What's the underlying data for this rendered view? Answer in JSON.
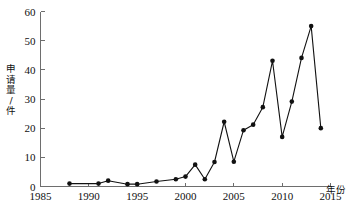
{
  "chart_data": {
    "type": "line",
    "title": "",
    "subtitle": "",
    "xlabel": "年份",
    "ylabel": "申请量/件",
    "xlim": [
      1985,
      2015
    ],
    "ylim": [
      0,
      60
    ],
    "xticks": [
      1985,
      1990,
      1995,
      2000,
      2005,
      2010,
      2015
    ],
    "yticks": [
      0,
      10,
      20,
      30,
      40,
      50,
      60
    ],
    "xtick_labels": [
      "1985",
      "1990",
      "1995",
      "2000",
      "2005",
      "2010",
      "2015"
    ],
    "ytick_labels": [
      "0",
      "10",
      "20",
      "30",
      "40",
      "50",
      "60"
    ],
    "grid": false,
    "legend": false,
    "legend_position": "none",
    "marker": "filled-circle",
    "line_color": "#111111",
    "marker_color": "#111111",
    "axis_color": "#6e6e6e",
    "background_color": "#ffffff",
    "x": [
      1988,
      1991,
      1992,
      1994,
      1995,
      1997,
      1999,
      2000,
      2001,
      2002,
      2003,
      2004,
      2005,
      2006,
      2007,
      2008,
      2009,
      2010,
      2011,
      2012,
      2013,
      2014
    ],
    "values": [
      1,
      1,
      2,
      0.8,
      0.8,
      1.7,
      2.5,
      3.4,
      7.5,
      2.5,
      8.4,
      22.2,
      8.5,
      19.3,
      21.2,
      27.2,
      43.1,
      17,
      29.1,
      44.1,
      55,
      20
    ],
    "series": [
      {
        "name": "申请量",
        "x": [
          1988,
          1991,
          1992,
          1994,
          1995,
          1997,
          1999,
          2000,
          2001,
          2002,
          2003,
          2004,
          2005,
          2006,
          2007,
          2008,
          2009,
          2010,
          2011,
          2012,
          2013,
          2014
        ],
        "values": [
          1,
          1,
          2,
          0.8,
          0.8,
          1.7,
          2.5,
          3.4,
          7.5,
          2.5,
          8.4,
          22.2,
          8.5,
          19.3,
          21.2,
          27.2,
          43.1,
          17,
          29.1,
          44.1,
          55,
          20
        ]
      }
    ]
  }
}
